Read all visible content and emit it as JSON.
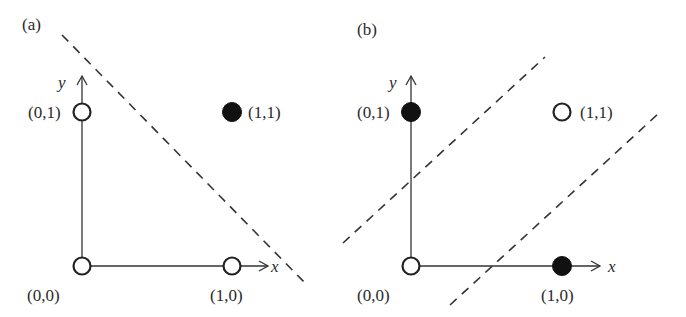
{
  "panels": [
    {
      "id": "a",
      "label": "(a)",
      "title_note": "AND-like separable case",
      "axes": {
        "x_label": "x",
        "y_label": "y"
      },
      "points": [
        {
          "coord": "(0,0)",
          "x": 0,
          "y": 0,
          "filled": false
        },
        {
          "coord": "(0,1)",
          "x": 0,
          "y": 1,
          "filled": false
        },
        {
          "coord": "(1,0)",
          "x": 1,
          "y": 0,
          "filled": false
        },
        {
          "coord": "(1,1)",
          "x": 1,
          "y": 1,
          "filled": true
        }
      ],
      "decision_lines": 1
    },
    {
      "id": "b",
      "label": "(b)",
      "axes": {
        "x_label": "x",
        "y_label": "y"
      },
      "points": [
        {
          "coord": "(0,0)",
          "x": 0,
          "y": 0,
          "filled": false
        },
        {
          "coord": "(0,1)",
          "x": 0,
          "y": 1,
          "filled": true
        },
        {
          "coord": "(1,0)",
          "x": 1,
          "y": 0,
          "filled": true
        },
        {
          "coord": "(1,1)",
          "x": 1,
          "y": 1,
          "filled": false
        }
      ],
      "decision_lines": 2
    }
  ],
  "colors": {
    "ink": "#222222",
    "background": "#ffffff"
  }
}
